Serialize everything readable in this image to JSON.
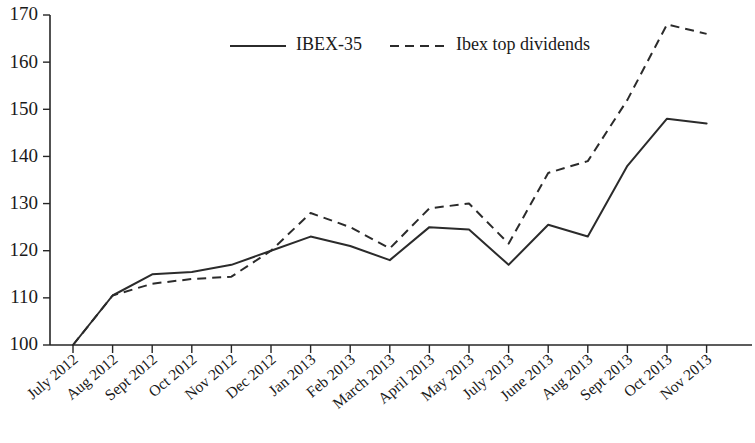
{
  "chart_data": {
    "type": "line",
    "title": "",
    "subtitle": "",
    "xlabel": "",
    "ylabel": "",
    "ylim": [
      100,
      170
    ],
    "ytick_values": [
      100,
      110,
      120,
      130,
      140,
      150,
      160,
      170
    ],
    "ytick_labels": [
      "100",
      "110",
      "120",
      "130",
      "140",
      "150",
      "160",
      "170"
    ],
    "grid": false,
    "legend_position": "top-center",
    "categories": [
      "July 2012",
      "Aug 2012",
      "Sept 2012",
      "Oct 2012",
      "Nov 2012",
      "Dec 2012",
      "Jan 2013",
      "Feb 2013",
      "March 2013",
      "April 2013",
      "May 2013",
      "July 2013",
      "June 2013",
      "Aug 2013",
      "Sept 2013",
      "Oct 2013",
      "Nov 2013"
    ],
    "series": [
      {
        "name": "IBEX-35",
        "style": "solid",
        "color": "#2b2b2b",
        "values": [
          100,
          110.5,
          115,
          115.5,
          117,
          120,
          123,
          121,
          118,
          125,
          124.5,
          117,
          125.5,
          123,
          138,
          148,
          147
        ]
      },
      {
        "name": "Ibex top dividends",
        "style": "dashed",
        "color": "#2b2b2b",
        "values": [
          100,
          110.5,
          113,
          114,
          114.5,
          120,
          128,
          125,
          120.5,
          129,
          130,
          121.5,
          136.5,
          139,
          152,
          168,
          166
        ]
      }
    ]
  },
  "legend": {
    "entries": [
      {
        "label": "IBEX-35",
        "style": "solid"
      },
      {
        "label": "Ibex top dividends",
        "style": "dashed"
      }
    ]
  }
}
